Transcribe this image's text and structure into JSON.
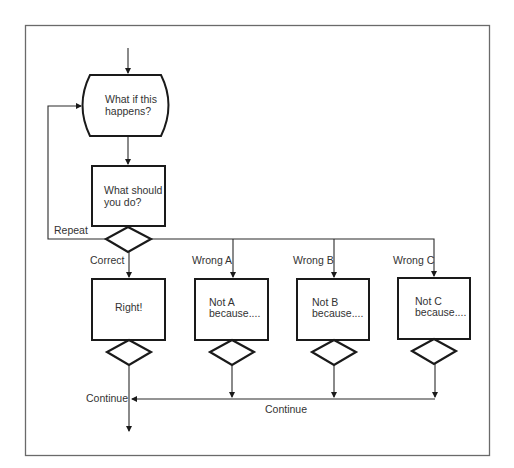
{
  "diagram": {
    "type": "flowchart",
    "nodes": {
      "question": {
        "line1": "What if this",
        "line2": "happens?"
      },
      "action": {
        "line1": "What should",
        "line2": "you do?"
      },
      "right": {
        "text": "Right!"
      },
      "not_a": {
        "line1": "Not A",
        "line2": "because...."
      },
      "not_b": {
        "line1": "Not B",
        "line2": "because...."
      },
      "not_c": {
        "line1": "Not C",
        "line2": "because...."
      }
    },
    "edge_labels": {
      "repeat": "Repeat",
      "correct": "Correct",
      "wrong_a": "Wrong A",
      "wrong_b": "Wrong B",
      "wrong_c": "Wrong C",
      "continue_left": "Continue",
      "continue_bottom": "Continue"
    },
    "colors": {
      "stroke": "#1a1a1a",
      "text": "#333333",
      "frame": "#6a6a6a",
      "background": "#ffffff"
    }
  }
}
